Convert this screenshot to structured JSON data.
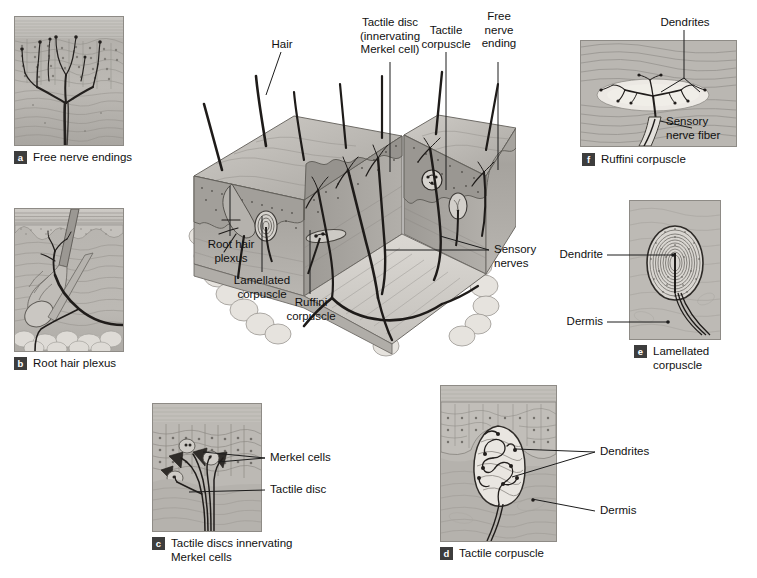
{
  "figure": {
    "background": "#ffffff",
    "ink": "#1c1c1c",
    "tissue_tone": "#b9b6b1"
  },
  "panels": [
    {
      "letter": "a",
      "caption": "Free nerve endings"
    },
    {
      "letter": "b",
      "caption": "Root hair plexus"
    },
    {
      "letter": "c",
      "caption": "Tactile discs innervating\nMerkel cells"
    },
    {
      "letter": "d",
      "caption": "Tactile corpuscle"
    },
    {
      "letter": "e",
      "caption": "Lamellated\ncorpuscle"
    },
    {
      "letter": "f",
      "caption": "Ruffini corpuscle"
    }
  ],
  "central_diagram": {
    "labels_top": [
      {
        "text": "Hair"
      },
      {
        "text": "Tactile disc\n(innervating\nMerkel cell)"
      },
      {
        "text": "Tactile\ncorpuscle"
      },
      {
        "text": "Free\nnerve\nending"
      }
    ],
    "labels_bottom": [
      {
        "text": "Root hair\nplexus"
      },
      {
        "text": "Lamellated\ncorpuscle"
      },
      {
        "text": "Ruffini\ncorpuscle"
      }
    ],
    "labels_right": [
      {
        "text": "Sensory\nnerves"
      }
    ]
  },
  "panel_f_labels": [
    {
      "text": "Dendrites"
    },
    {
      "text": "Sensory\nnerve fiber"
    }
  ],
  "panel_e_labels": [
    {
      "text": "Dendrite"
    },
    {
      "text": "Dermis"
    }
  ],
  "panel_c_labels": [
    {
      "text": "Merkel cells"
    },
    {
      "text": "Tactile disc"
    }
  ],
  "panel_d_labels": [
    {
      "text": "Dendrites"
    },
    {
      "text": "Dermis"
    }
  ]
}
